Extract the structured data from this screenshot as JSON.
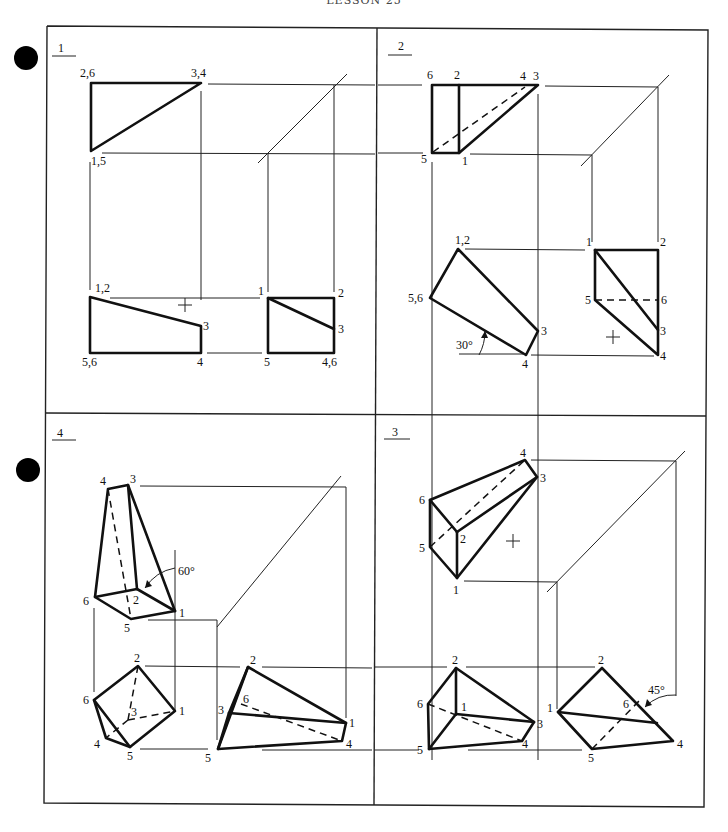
{
  "header": {
    "title": "LESSON 25"
  },
  "bullets": 2,
  "panels": [
    {
      "number": "1",
      "views": {
        "top": {
          "labels": [
            "2,6",
            "3,4",
            "1,5"
          ]
        },
        "front": {
          "labels": [
            "1,2",
            "3",
            "5,6",
            "4"
          ]
        },
        "side": {
          "labels": [
            "1",
            "2",
            "3",
            "5",
            "4,6"
          ]
        }
      }
    },
    {
      "number": "2",
      "views": {
        "top": {
          "labels": [
            "6",
            "2",
            "4",
            "3",
            "5",
            "1"
          ]
        },
        "front": {
          "labels": [
            "1,2",
            "5,6",
            "3",
            "4"
          ],
          "angle": "30°"
        },
        "side": {
          "labels": [
            "1",
            "2",
            "5",
            "6",
            "3",
            "4"
          ]
        }
      }
    },
    {
      "number": "3",
      "views": {
        "top": {
          "labels": [
            "4",
            "3",
            "6",
            "2",
            "5",
            "1"
          ]
        },
        "front": {
          "labels": [
            "2",
            "6",
            "1",
            "3",
            "5",
            "4"
          ]
        },
        "side": {
          "labels": [
            "2",
            "1",
            "6",
            "4",
            "5"
          ],
          "angle": "45°"
        }
      }
    },
    {
      "number": "4",
      "views": {
        "top": {
          "labels": [
            "4",
            "3",
            "6",
            "2",
            "5",
            "1"
          ],
          "angle": "60°"
        },
        "front": {
          "labels": [
            "2",
            "6",
            "3",
            "1",
            "4",
            "5"
          ]
        },
        "side": {
          "labels": [
            "2",
            "6",
            "1",
            "3",
            "4",
            "5"
          ]
        }
      }
    }
  ]
}
